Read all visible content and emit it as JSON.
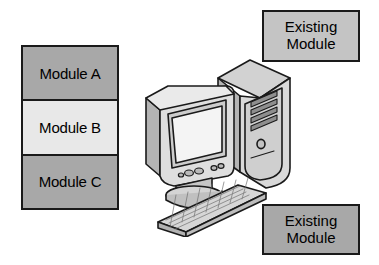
{
  "diagram": {
    "background_color": "#ffffff",
    "outline_color": "#1a1a1a"
  },
  "module_stack": {
    "name": "module-stack",
    "rows": [
      {
        "label": "Module A",
        "fill": "#a8a8a8",
        "state": "new"
      },
      {
        "label": "Module B",
        "fill": "#e8e8e8",
        "state": "new"
      },
      {
        "label": "Module C",
        "fill": "#a8a8a8",
        "state": "new"
      }
    ]
  },
  "existing_modules": [
    {
      "name": "existing-module-top",
      "line1": "Existing",
      "line2": "Module",
      "fill": "#c4c4c4",
      "position": "top-right"
    },
    {
      "name": "existing-module-bottom",
      "line1": "Existing",
      "line2": "Module",
      "fill": "#a8a8a8",
      "position": "bottom-right"
    }
  ],
  "computer": {
    "name": "desktop-computer-illustration",
    "parts": [
      {
        "name": "crt-monitor",
        "label": "CRT monitor"
      },
      {
        "name": "monitor-screen",
        "label": "Screen"
      },
      {
        "name": "monitor-stand",
        "label": "Monitor stand"
      },
      {
        "name": "monitor-control-buttons",
        "label": "Monitor control buttons"
      },
      {
        "name": "computer-tower",
        "label": "Tower case"
      },
      {
        "name": "tower-drive-bays",
        "label": "Drive bays"
      },
      {
        "name": "tower-power-button",
        "label": "Power button"
      },
      {
        "name": "keyboard",
        "label": "Keyboard"
      }
    ],
    "colors": {
      "body_light": "#e3e3e3",
      "body_mid": "#c9c9c9",
      "body_dark": "#b0b0b0",
      "screen": "#f2f2f2",
      "outline": "#1a1a1a"
    }
  }
}
